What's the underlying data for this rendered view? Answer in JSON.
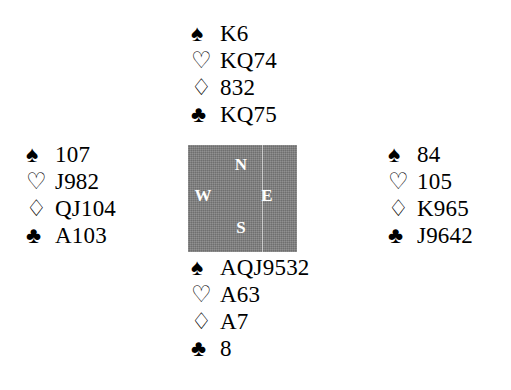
{
  "diagram": {
    "type": "bridge-hand-diagram",
    "suit_glyphs": {
      "spades": "♠",
      "hearts": "♡",
      "diamonds": "♢",
      "clubs": "♣"
    },
    "box_color": "#808080",
    "label_color": "#ffffff",
    "text_color": "#000000",
    "background_color": "#ffffff"
  },
  "compass": {
    "north": "N",
    "west": "W",
    "east": "E",
    "south": "S"
  },
  "hands": {
    "north": {
      "position": "North",
      "spades": "K6",
      "hearts": "KQ74",
      "diamonds": "832",
      "clubs": "KQ75"
    },
    "west": {
      "position": "West",
      "spades": "107",
      "hearts": "J982",
      "diamonds": "QJ104",
      "clubs": "A103"
    },
    "east": {
      "position": "East",
      "spades": "84",
      "hearts": "105",
      "diamonds": "K965",
      "clubs": "J9642"
    },
    "south": {
      "position": "South",
      "spades": "AQJ9532",
      "hearts": "A63",
      "diamonds": "A7",
      "clubs": "8"
    }
  }
}
